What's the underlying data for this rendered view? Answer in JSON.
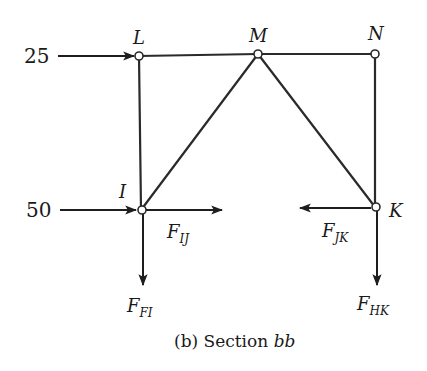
{
  "diagram": {
    "caption": {
      "prefix": "(b) Section ",
      "emph": "bb"
    },
    "nodes": [
      {
        "id": "L",
        "label": "L",
        "x": 139,
        "y": 56
      },
      {
        "id": "M",
        "label": "M",
        "x": 258,
        "y": 54
      },
      {
        "id": "N",
        "label": "N",
        "x": 375,
        "y": 54
      },
      {
        "id": "I",
        "label": "I",
        "x": 141,
        "y": 210
      },
      {
        "id": "K",
        "label": "K",
        "x": 375,
        "y": 207
      }
    ],
    "members": [
      [
        "L",
        "M"
      ],
      [
        "M",
        "N"
      ],
      [
        "L",
        "I"
      ],
      [
        "I",
        "M"
      ],
      [
        "M",
        "K"
      ],
      [
        "N",
        "K"
      ]
    ],
    "applied_loads": [
      {
        "id": "load-25",
        "value": "25",
        "at": "L",
        "direction": "right"
      },
      {
        "id": "load-50",
        "value": "50",
        "at": "I",
        "direction": "right"
      }
    ],
    "member_forces": [
      {
        "id": "F_IJ",
        "symbol": "F",
        "subscript": "IJ",
        "at": "I",
        "direction": "right"
      },
      {
        "id": "F_FI",
        "symbol": "F",
        "subscript": "FI",
        "at": "I",
        "direction": "down"
      },
      {
        "id": "F_JK",
        "symbol": "F",
        "subscript": "JK",
        "at": "K",
        "direction": "left"
      },
      {
        "id": "F_HK",
        "symbol": "F",
        "subscript": "HK",
        "at": "K",
        "direction": "down"
      }
    ]
  }
}
